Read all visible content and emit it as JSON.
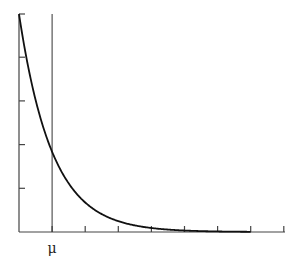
{
  "chart_data": {
    "type": "line",
    "title": "",
    "xlabel": "",
    "ylabel": "",
    "series": [
      {
        "name": "density",
        "function": "exp(-x/mu)",
        "x": [
          0,
          0.25,
          0.5,
          0.75,
          1,
          1.5,
          2,
          3,
          4,
          5,
          6,
          7
        ],
        "values": [
          1.0,
          0.779,
          0.607,
          0.472,
          0.368,
          0.223,
          0.135,
          0.05,
          0.018,
          0.007,
          0.002,
          0.001
        ]
      }
    ],
    "annotations": [
      {
        "type": "vline",
        "x": 1,
        "label": "μ"
      }
    ],
    "x_ticks": {
      "count": 7,
      "spacing_in_mu": 1,
      "labels": [
        "",
        "μ",
        "",
        "",
        "",
        "",
        ""
      ]
    },
    "y_ticks": {
      "count": 4,
      "labels": []
    },
    "xlim": [
      0,
      7
    ],
    "ylim": [
      0,
      1
    ],
    "grid": false,
    "legend": "none",
    "colors": {
      "curve": "#111111",
      "axis": "#444444",
      "vline": "#333333"
    }
  },
  "labels": {
    "mu": "μ"
  }
}
